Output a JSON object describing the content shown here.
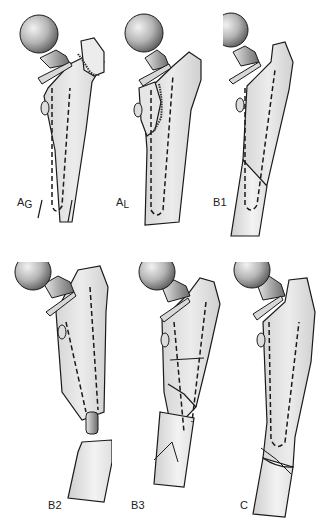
{
  "figure": {
    "type": "Classification diagram of periprosthetic femoral fractures",
    "panels": [
      {
        "id": "AG",
        "label_main": "A",
        "label_sub": "G",
        "description": "Greater trochanter fracture"
      },
      {
        "id": "AL",
        "label_main": "A",
        "label_sub": "L",
        "description": "Lesser trochanter fracture"
      },
      {
        "id": "B1",
        "label_main": "B1",
        "label_sub": "",
        "description": "Fracture around stem, stable implant"
      },
      {
        "id": "B2",
        "label_main": "B2",
        "label_sub": "",
        "description": "Fracture around stem, loose implant"
      },
      {
        "id": "B3",
        "label_main": "B3",
        "label_sub": "",
        "description": "Fracture around stem, poor bone stock"
      },
      {
        "id": "C",
        "label_main": "C",
        "label_sub": "",
        "description": "Fracture well below stem tip"
      }
    ],
    "colors": {
      "bone_fill": "#e4e4e4",
      "bone_outline": "#1a1a1a",
      "head_light": "#eeeeee",
      "head_dark": "#6a6a6a",
      "background": "#ffffff"
    }
  }
}
